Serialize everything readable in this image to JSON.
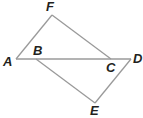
{
  "diagram": {
    "type": "geometry",
    "points": {
      "A": {
        "label": "A",
        "x": 16,
        "y": 59
      },
      "B": {
        "label": "B",
        "x": 36,
        "y": 59
      },
      "C": {
        "label": "C",
        "x": 111,
        "y": 59
      },
      "D": {
        "label": "D",
        "x": 131,
        "y": 59
      },
      "E": {
        "label": "E",
        "x": 95,
        "y": 103
      },
      "F": {
        "label": "F",
        "x": 52,
        "y": 15
      }
    },
    "segments": [
      "AD",
      "AF",
      "FC",
      "BE",
      "ED"
    ],
    "line_color": "#9a9a9a",
    "label_color": "#231f20"
  }
}
